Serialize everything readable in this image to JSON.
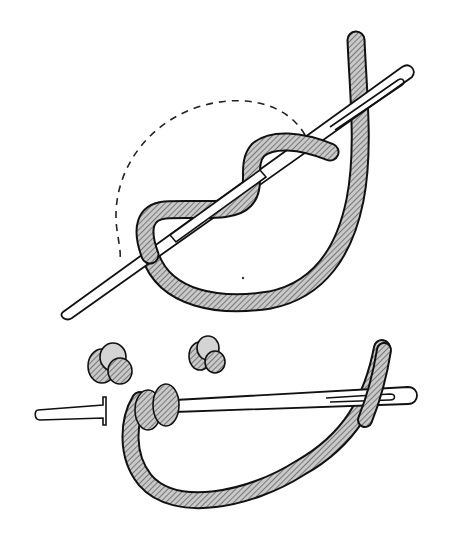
{
  "figure": {
    "panels": [
      {
        "id": "step-wrap",
        "description": "Needle with thread wrapped around it, dashed guide circle"
      },
      {
        "id": "step-pull",
        "description": "Needle pulled through wrapped thread coils, two finished knots shown above"
      }
    ],
    "colors": {
      "background": "#ffffff",
      "ink": "#111111",
      "thread_fill": "#c9c9c9",
      "needle_fill": "#ffffff"
    }
  }
}
